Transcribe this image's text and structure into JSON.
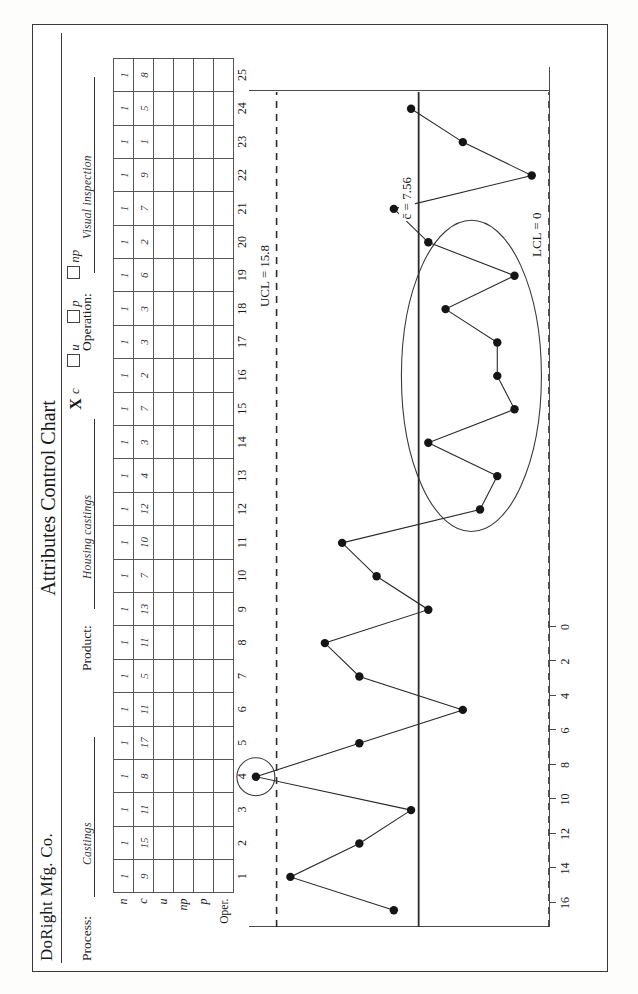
{
  "header": {
    "company": "DoRight Mfg. Co.",
    "title": "Attributes Control Chart",
    "process_label": "Process:",
    "process_value": "Castings",
    "product_label": "Product:",
    "product_value": "Housing castings",
    "operation_label": "Operation:",
    "operation_value": "Visual inspection",
    "chart_type_options": [
      {
        "id": "c",
        "label": "c",
        "checked": true,
        "mark": "X"
      },
      {
        "id": "u",
        "label": "u",
        "checked": false,
        "mark": ""
      },
      {
        "id": "p",
        "label": "p",
        "checked": false,
        "mark": ""
      },
      {
        "id": "np",
        "label": "np",
        "checked": false,
        "mark": ""
      }
    ]
  },
  "table": {
    "row_labels": [
      "n",
      "c",
      "u",
      "np",
      "p",
      "Oper."
    ],
    "sample_numbers": [
      1,
      2,
      3,
      4,
      5,
      6,
      7,
      8,
      9,
      10,
      11,
      12,
      13,
      14,
      15,
      16,
      17,
      18,
      19,
      20,
      21,
      22,
      23,
      24,
      25
    ],
    "n": [
      "1",
      "1",
      "1",
      "1",
      "1",
      "1",
      "1",
      "1",
      "1",
      "1",
      "1",
      "1",
      "1",
      "1",
      "1",
      "1",
      "1",
      "1",
      "1",
      "1",
      "1",
      "1",
      "1",
      "1",
      "1"
    ],
    "c": [
      "9",
      "15",
      "11",
      "8",
      "17",
      "11",
      "5",
      "11",
      "13",
      "7",
      "10",
      "12",
      "4",
      "3",
      "7",
      "2",
      "3",
      "3",
      "6",
      "2",
      "7",
      "9",
      "1",
      "5",
      "8"
    ],
    "u": [
      "",
      "",
      "",
      "",
      "",
      "",
      "",
      "",
      "",
      "",
      "",
      "",
      "",
      "",
      "",
      "",
      "",
      "",
      "",
      "",
      "",
      "",
      "",
      "",
      ""
    ],
    "np": [
      "",
      "",
      "",
      "",
      "",
      "",
      "",
      "",
      "",
      "",
      "",
      "",
      "",
      "",
      "",
      "",
      "",
      "",
      "",
      "",
      "",
      "",
      "",
      "",
      ""
    ],
    "p": [
      "",
      "",
      "",
      "",
      "",
      "",
      "",
      "",
      "",
      "",
      "",
      "",
      "",
      "",
      "",
      "",
      "",
      "",
      "",
      "",
      "",
      "",
      "",
      "",
      ""
    ],
    "oper": [
      "",
      "",
      "",
      "",
      "",
      "",
      "",
      "",
      "",
      "",
      "",
      "",
      "",
      "",
      "",
      "",
      "",
      "",
      "",
      "",
      "",
      "",
      "",
      "",
      ""
    ]
  },
  "chart_labels": {
    "ucl": "UCL = 15.8",
    "center": "c̄ = 7.56",
    "lcl": "LCL = 0"
  },
  "chart_data": {
    "type": "line",
    "title": "Attributes Control Chart",
    "xlabel": "",
    "ylabel": "",
    "x": [
      1,
      2,
      3,
      4,
      5,
      6,
      7,
      8,
      9,
      10,
      11,
      12,
      13,
      14,
      15,
      16,
      17,
      18,
      19,
      20,
      21,
      22,
      23,
      24,
      25
    ],
    "values": [
      9,
      15,
      11,
      8,
      17,
      11,
      5,
      11,
      13,
      7,
      10,
      12,
      4,
      3,
      7,
      2,
      3,
      3,
      6,
      2,
      7,
      9,
      1,
      5,
      8
    ],
    "ylim": [
      0,
      17.4
    ],
    "yticks": [
      0,
      2,
      4,
      6,
      8,
      10,
      12,
      14,
      16
    ],
    "ytick_labels": [
      "0",
      "2",
      "4",
      "6",
      "8",
      "10",
      "12",
      "14",
      "16"
    ],
    "xticks": [
      1,
      2,
      3,
      4,
      5,
      6,
      7,
      8,
      9,
      10,
      11,
      12,
      13,
      14,
      15,
      16,
      17,
      18,
      19,
      20,
      21,
      22,
      23,
      24,
      25
    ],
    "ucl": 15.8,
    "center_line": 7.56,
    "lcl": 0,
    "grid": false,
    "legend": "none",
    "annotations": [
      {
        "type": "circle",
        "label": "out-of-control-point",
        "points": [
          5
        ]
      },
      {
        "type": "ellipse",
        "label": "run-below-center-line",
        "points": [
          13,
          14,
          15,
          16,
          17,
          18,
          19,
          20,
          21
        ]
      }
    ]
  },
  "colors": {
    "ink": "#1a1a1a",
    "rule": "#4a4a4a",
    "handwriting": "#35353c"
  }
}
